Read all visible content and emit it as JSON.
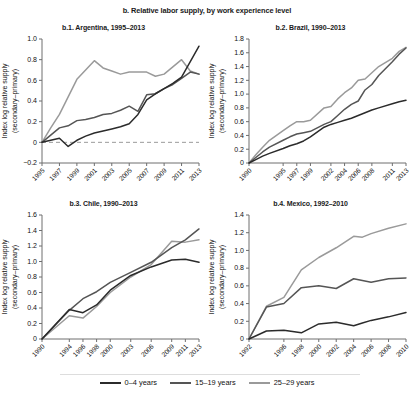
{
  "figure": {
    "title": "b. Relative labor supply, by work experience level"
  },
  "legend": {
    "position": "bottom-center",
    "items": [
      {
        "label": "0–4 years",
        "color": "#2b2b2b"
      },
      {
        "label": "15–19 years",
        "color": "#555555"
      },
      {
        "label": "25–29 years",
        "color": "#9a9a9a"
      }
    ]
  },
  "chart_data": [
    {
      "id": "b1",
      "type": "line",
      "title": "b.1. Argentina, 1995–2013",
      "xlabel": "",
      "ylabel": "Index log relative supply\n(secondary–primary)",
      "ylabel_line1": "Index log relative supply",
      "ylabel_line2": "(secondary–primary)",
      "xlim": [
        1995,
        2013
      ],
      "ylim": [
        -0.2,
        1.0
      ],
      "yticks": [
        -0.2,
        0,
        0.2,
        0.4,
        0.6,
        0.8,
        1.0
      ],
      "yticklabels": [
        "−0.2",
        "0",
        "0.2",
        "0.4",
        "0.6",
        "0.8",
        "1.0"
      ],
      "xticks": [
        1995,
        1997,
        1999,
        2001,
        2003,
        2005,
        2007,
        2009,
        2011,
        2013
      ],
      "xticklabels": [
        "1995",
        "1997",
        "1999",
        "2001",
        "2003",
        "2005",
        "2007",
        "2009",
        "2011",
        "2013"
      ],
      "grid": false,
      "zero_reference_line": 0,
      "x": [
        1995,
        1996,
        1997,
        1998,
        1999,
        2000,
        2001,
        2002,
        2003,
        2004,
        2005,
        2006,
        2007,
        2008,
        2009,
        2010,
        2011,
        2012,
        2013
      ],
      "series": [
        {
          "name": "0–4 years",
          "color": "#2b2b2b",
          "values": [
            0.0,
            0.02,
            0.04,
            -0.04,
            0.02,
            0.06,
            0.09,
            0.11,
            0.13,
            0.15,
            0.18,
            0.27,
            0.41,
            0.47,
            0.52,
            0.57,
            0.63,
            0.78,
            0.93
          ]
        },
        {
          "name": "15–19 years",
          "color": "#555555",
          "values": [
            0.0,
            0.07,
            0.14,
            0.16,
            0.21,
            0.22,
            0.24,
            0.27,
            0.28,
            0.31,
            0.35,
            0.3,
            0.46,
            0.47,
            0.52,
            0.56,
            0.62,
            0.68,
            0.66
          ]
        },
        {
          "name": "25–29 years",
          "color": "#9a9a9a",
          "values": [
            0.0,
            0.14,
            0.27,
            0.44,
            0.61,
            0.7,
            0.79,
            0.72,
            0.69,
            0.66,
            0.68,
            0.68,
            0.68,
            0.64,
            0.66,
            0.73,
            0.8,
            0.69,
            0.66
          ]
        }
      ]
    },
    {
      "id": "b2",
      "type": "line",
      "title": "b.2. Brazil, 1990–2013",
      "xlabel": "",
      "ylabel_line1": "Index log relative supply",
      "ylabel_line2": "(secondary–primary)",
      "xlim": [
        1990,
        2013
      ],
      "ylim": [
        0,
        1.8
      ],
      "yticks": [
        0,
        0.2,
        0.4,
        0.6,
        0.8,
        1.0,
        1.2,
        1.4,
        1.6,
        1.8
      ],
      "yticklabels": [
        "0",
        "0.2",
        "0.4",
        "0.6",
        "0.8",
        "1.0",
        "1.2",
        "1.4",
        "1.6",
        "1.8"
      ],
      "xticks": [
        1990,
        1995,
        1997,
        1999,
        2002,
        2004,
        2006,
        2008,
        2011,
        2013
      ],
      "xticklabels": [
        "1990",
        "1995",
        "1997",
        "1999",
        "2002",
        "2004",
        "2006",
        "2008",
        "2011",
        "2013"
      ],
      "grid": false,
      "x": [
        1990,
        1991,
        1992,
        1993,
        1995,
        1996,
        1997,
        1998,
        1999,
        2001,
        2002,
        2003,
        2004,
        2005,
        2006,
        2007,
        2008,
        2009,
        2011,
        2012,
        2013
      ],
      "series": [
        {
          "name": "0–4 years",
          "color": "#2b2b2b",
          "values": [
            0.0,
            0.05,
            0.1,
            0.14,
            0.21,
            0.25,
            0.28,
            0.32,
            0.38,
            0.52,
            0.56,
            0.59,
            0.62,
            0.65,
            0.69,
            0.73,
            0.77,
            0.8,
            0.86,
            0.89,
            0.91
          ]
        },
        {
          "name": "15–19 years",
          "color": "#555555",
          "values": [
            0.0,
            0.08,
            0.16,
            0.23,
            0.33,
            0.38,
            0.42,
            0.44,
            0.46,
            0.56,
            0.6,
            0.69,
            0.78,
            0.85,
            0.9,
            1.06,
            1.14,
            1.27,
            1.47,
            1.58,
            1.67
          ]
        },
        {
          "name": "25–29 years",
          "color": "#9a9a9a",
          "values": [
            0.0,
            0.12,
            0.23,
            0.33,
            0.47,
            0.54,
            0.6,
            0.6,
            0.62,
            0.8,
            0.82,
            0.93,
            1.02,
            1.09,
            1.2,
            1.22,
            1.31,
            1.4,
            1.52,
            1.62,
            1.68
          ]
        }
      ]
    },
    {
      "id": "b3",
      "type": "line",
      "title": "b.3. Chile, 1990–2013",
      "xlabel": "",
      "ylabel_line1": "Index log relative supply",
      "ylabel_line2": "(secondary–primary)",
      "xlim": [
        1990,
        2013
      ],
      "ylim": [
        0,
        1.6
      ],
      "yticks": [
        0,
        0.2,
        0.4,
        0.6,
        0.8,
        1.0,
        1.2,
        1.4,
        1.6
      ],
      "yticklabels": [
        "0",
        "0.2",
        "0.4",
        "0.6",
        "0.8",
        "1.0",
        "1.2",
        "1.4",
        "1.6"
      ],
      "xticks": [
        1990,
        1994,
        1996,
        1998,
        2000,
        2003,
        2006,
        2009,
        2011,
        2013
      ],
      "xticklabels": [
        "1990",
        "1994",
        "1996",
        "1998",
        "2000",
        "2003",
        "2006",
        "2009",
        "2011",
        "2013"
      ],
      "grid": false,
      "x": [
        1990,
        1994,
        1996,
        1998,
        2000,
        2003,
        2006,
        2009,
        2011,
        2013
      ],
      "series": [
        {
          "name": "0–4 years",
          "color": "#2b2b2b",
          "values": [
            0.0,
            0.38,
            0.34,
            0.44,
            0.63,
            0.82,
            0.93,
            1.02,
            1.03,
            0.99
          ]
        },
        {
          "name": "15–19 years",
          "color": "#555555",
          "values": [
            0.0,
            0.37,
            0.52,
            0.61,
            0.73,
            0.86,
            0.99,
            1.18,
            1.28,
            1.42
          ]
        },
        {
          "name": "25–29 years",
          "color": "#9a9a9a",
          "values": [
            0.0,
            0.3,
            0.27,
            0.42,
            0.6,
            0.8,
            0.96,
            1.26,
            1.25,
            1.28
          ]
        }
      ]
    },
    {
      "id": "b4",
      "type": "line",
      "title": "b.4. Mexico, 1992–2010",
      "xlabel": "",
      "ylabel_line1": "Index log relative supply",
      "ylabel_line2": "(secondary–primary)",
      "xlim": [
        1992,
        2010
      ],
      "ylim": [
        0,
        1.4
      ],
      "yticks": [
        0,
        0.2,
        0.4,
        0.6,
        0.8,
        1.0,
        1.2,
        1.4
      ],
      "yticklabels": [
        "0",
        "0.2",
        "0.4",
        "0.6",
        "0.8",
        "1.0",
        "1.2",
        "1.4"
      ],
      "xticks": [
        1992,
        1996,
        1998,
        2000,
        2002,
        2004,
        2006,
        2008,
        2010
      ],
      "xticklabels": [
        "1992",
        "1996",
        "1998",
        "2000",
        "2002",
        "2004",
        "2006",
        "2008",
        "2010"
      ],
      "grid": false,
      "x": [
        1992,
        1994,
        1996,
        1998,
        2000,
        2002,
        2004,
        2005,
        2006,
        2008,
        2010
      ],
      "series": [
        {
          "name": "0–4 years",
          "color": "#2b2b2b",
          "values": [
            0.0,
            0.09,
            0.1,
            0.07,
            0.17,
            0.19,
            0.15,
            0.18,
            0.21,
            0.25,
            0.3
          ]
        },
        {
          "name": "15–19 years",
          "color": "#555555",
          "values": [
            0.0,
            0.36,
            0.4,
            0.58,
            0.6,
            0.57,
            0.68,
            0.66,
            0.64,
            0.68,
            0.69
          ]
        },
        {
          "name": "25–29 years",
          "color": "#9a9a9a",
          "values": [
            0.0,
            0.37,
            0.47,
            0.78,
            0.92,
            1.03,
            1.16,
            1.15,
            1.19,
            1.25,
            1.3
          ]
        }
      ]
    }
  ]
}
